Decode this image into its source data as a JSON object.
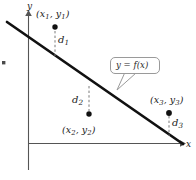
{
  "figure": {
    "width": 196,
    "height": 180,
    "background_color": "#ffffff",
    "line_color": "#111111",
    "dashed_color": "#7a7a7a",
    "callout_border_color": "#9a9a9a",
    "axis_color": "#555555",
    "text_color": "#1a1a1a"
  },
  "axes": {
    "y_label": "y",
    "x_label": "x",
    "origin": {
      "x": 28,
      "y": 143
    },
    "x_axis_end": {
      "x": 184,
      "y": 143
    },
    "y_axis_top": {
      "x": 28,
      "y": 12
    }
  },
  "callout": {
    "text": "y = f(x)",
    "box": {
      "x": 110,
      "y": 57,
      "width": 50,
      "height": 17
    },
    "tail_tip": {
      "x": 118,
      "y": 90
    }
  },
  "fit_line": {
    "label": "y = f(x)",
    "start": {
      "x": 7,
      "y": 22
    },
    "end": {
      "x": 183,
      "y": 144
    },
    "stroke_width": 2.6
  },
  "points": [
    {
      "id": "p1",
      "label": "(x1, y1)",
      "label_main_x": "(x",
      "label_sub_1": "1",
      "label_mid": ", y",
      "label_sub_2": "1",
      "label_close": ")",
      "dot": {
        "x": 55,
        "y": 27
      },
      "deviation_label": "d",
      "deviation_sub": "1",
      "deviation_id": "d1",
      "dash_from": {
        "x": 55,
        "y": 30
      },
      "dash_to": {
        "x": 55,
        "y": 55
      }
    },
    {
      "id": "p2",
      "label": "(x2, y2)",
      "label_main_x": "(x",
      "label_sub_1": "2",
      "label_mid": ", y",
      "label_sub_2": "2",
      "label_close": ")",
      "dot": {
        "x": 89,
        "y": 114
      },
      "deviation_label": "d",
      "deviation_sub": "2",
      "deviation_id": "d2",
      "dash_from": {
        "x": 89,
        "y": 86
      },
      "dash_to": {
        "x": 89,
        "y": 111
      }
    },
    {
      "id": "p3",
      "label": "(x3, y3)",
      "label_main_x": "(x",
      "label_sub_1": "3",
      "label_mid": ", y",
      "label_sub_2": "3",
      "label_close": ")",
      "dot": {
        "x": 169,
        "y": 113
      },
      "deviation_label": "d",
      "deviation_sub": "3",
      "deviation_id": "d3",
      "dash_from": {
        "x": 169,
        "y": 116
      },
      "dash_to": {
        "x": 169,
        "y": 135
      }
    }
  ],
  "margin_mark": {
    "x": 3,
    "y": 62,
    "symbol": "•"
  }
}
